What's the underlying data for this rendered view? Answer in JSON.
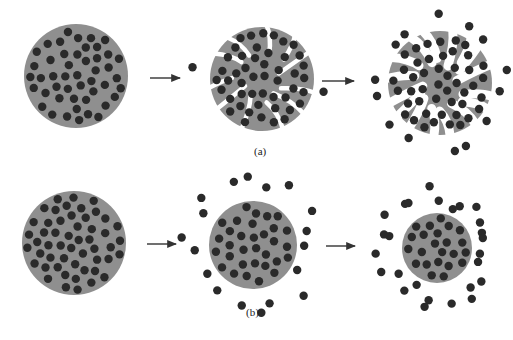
{
  "colors": {
    "matrix": "#8f8f8f",
    "particle": "#2a2a2a",
    "background": "#ffffff",
    "arrow": "#333333"
  },
  "rows": [
    {
      "label": "(a)",
      "description": "Matrix erosion / disintegration releasing particles",
      "stages": [
        {
          "name": "intact",
          "cx": 76,
          "cy": 76,
          "r": 52,
          "fragmented": false,
          "released": 0
        },
        {
          "name": "eroding",
          "cx": 262,
          "cy": 79,
          "r": 52,
          "fragmented": true,
          "released": 2
        },
        {
          "name": "disintegrated",
          "cx": 440,
          "cy": 83,
          "r": 52,
          "fragmented": true,
          "released": 14
        }
      ]
    },
    {
      "label": "(b)",
      "description": "Surface erosion: shrinking matrix releasing particles",
      "stages": [
        {
          "name": "intact",
          "cx": 74,
          "cy": 243,
          "r": 52,
          "fragmented": false,
          "released": 0
        },
        {
          "name": "shrinking",
          "cx": 253,
          "cy": 245,
          "r": 44,
          "fragmented": false,
          "released": 18
        },
        {
          "name": "shrunk",
          "cx": 437,
          "cy": 248,
          "r": 35,
          "fragmented": false,
          "released": 26
        }
      ]
    }
  ],
  "arrows": [
    {
      "x1": 150,
      "y1": 78,
      "x2": 180,
      "y2": 78
    },
    {
      "x1": 322,
      "y1": 81,
      "x2": 354,
      "y2": 81
    },
    {
      "x1": 147,
      "y1": 244,
      "x2": 176,
      "y2": 244
    },
    {
      "x1": 326,
      "y1": 246,
      "x2": 355,
      "y2": 246
    }
  ]
}
